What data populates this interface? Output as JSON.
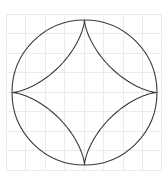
{
  "canvas": {
    "width": 165,
    "height": 179,
    "background_color": "#ffffff"
  },
  "grid": {
    "visible": true,
    "color": "#eceaec",
    "line_width": 1,
    "spacing_px": 19.5,
    "x_start": 6,
    "y_start": 14,
    "x_end": 161,
    "y_end": 177,
    "vertical_lines": [
      6,
      25.5,
      45,
      64.5,
      84,
      103.5,
      123,
      142.5,
      161
    ],
    "horizontal_lines": [
      14,
      33.5,
      53,
      72.5,
      92,
      111.5,
      131,
      150.5,
      170
    ]
  },
  "frame": {
    "visible": true,
    "color": "#f2f0f2",
    "x": 6,
    "y": 14,
    "width": 155,
    "height": 156
  },
  "chart_data": {
    "type": "diagram",
    "shapes": [
      {
        "name": "outer-circle",
        "kind": "circle",
        "cx": 84.5,
        "cy": 92.5,
        "r": 72.5,
        "stroke": "#3a3a3a",
        "stroke_width": 1.1,
        "fill": "none"
      },
      {
        "name": "astroid-star",
        "kind": "astroid",
        "cx": 84.5,
        "cy": 92.5,
        "r": 72.5,
        "cusps": [
          {
            "label": "top",
            "x": 84.5,
            "y": 20.0
          },
          {
            "label": "right",
            "x": 157.0,
            "y": 92.5
          },
          {
            "label": "bottom",
            "x": 84.5,
            "y": 165.0
          },
          {
            "label": "left",
            "x": 12.0,
            "y": 92.5
          }
        ],
        "stroke": "#3a3a3a",
        "stroke_width": 1.1,
        "fill": "none",
        "path": "M 84.5 20 C 84.5 60.59 51.59 93.5 11 93.5 C 51.59 93.5 84.5 126.41 84.5 167 C 84.5 126.41 117.41 93.5 158 93.5 C 117.41 93.5 84.5 60.59 84.5 20 Z"
      }
    ],
    "stroke_color": "#3a3a3a",
    "fill": "none",
    "grid": true,
    "legend": null,
    "xlabel": "",
    "ylabel": ""
  }
}
